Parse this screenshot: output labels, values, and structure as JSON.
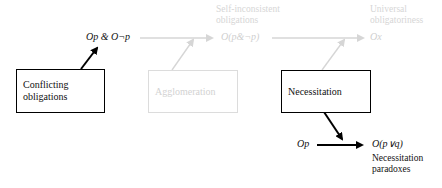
{
  "diagram": {
    "boxes": [
      {
        "id": "conflicting",
        "lines": [
          "Conflicting",
          "obligations"
        ],
        "faded": false
      },
      {
        "id": "agglomeration",
        "lines": [
          "Agglomeration"
        ],
        "faded": true
      },
      {
        "id": "necessitation",
        "lines": [
          "Necessitation"
        ],
        "faded": false
      }
    ],
    "formulas": {
      "conflict": "Op & O¬p",
      "self_inconsistent": "O(p&¬p)",
      "universal": "Ox",
      "necessitation_premise": "Op",
      "necessitation_result": "O(p∨q)"
    },
    "labels": {
      "self_inconsistent": [
        "Self-inconsistent",
        "obligations"
      ],
      "universal": [
        "Universal",
        "obligatoriness"
      ],
      "necessitation_paradoxes": [
        "Necessitation",
        "paradoxes"
      ]
    },
    "colors": {
      "active": "#000000",
      "faded": "#d6d6d6"
    }
  }
}
